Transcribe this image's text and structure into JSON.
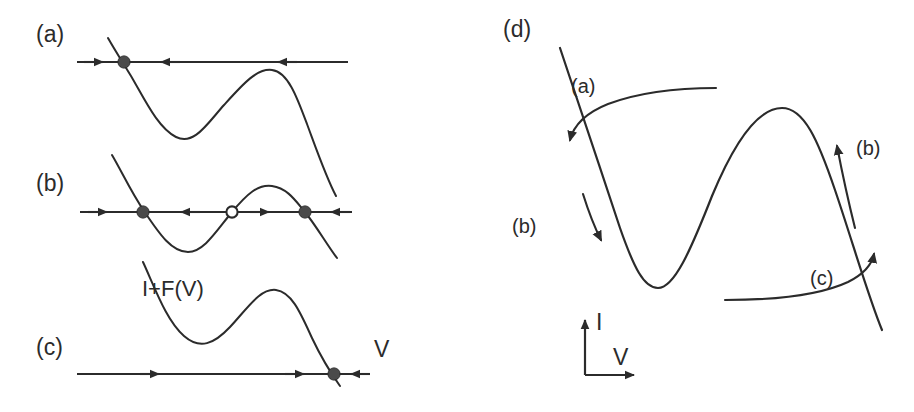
{
  "figure": {
    "width": 914,
    "height": 412,
    "background_color": "#ffffff",
    "ink_color": "#2b2b2b"
  },
  "panels": [
    {
      "id": "a",
      "label": "(a)",
      "description": "Phase line with one stable fixed point on the left branch; flow arrows point right then left toward it.",
      "fixed_points": [
        {
          "type": "filled",
          "role": "stable",
          "x": 124,
          "y": 62
        }
      ],
      "flow_arrows": [
        {
          "direction": "right",
          "x": 95,
          "y": 62
        },
        {
          "direction": "left",
          "x": 168,
          "y": 62
        },
        {
          "direction": "left",
          "x": 284,
          "y": 62
        }
      ]
    },
    {
      "id": "b",
      "label": "(b)",
      "description": "Phase line with three fixed points: stable, unstable (open), stable; bistable regime.",
      "fixed_points": [
        {
          "type": "filled",
          "role": "stable",
          "x": 143,
          "y": 212
        },
        {
          "type": "open",
          "role": "unstable",
          "x": 232,
          "y": 212
        },
        {
          "type": "filled",
          "role": "stable",
          "x": 305,
          "y": 212
        }
      ],
      "flow_arrows": [
        {
          "direction": "right",
          "x": 110,
          "y": 212
        },
        {
          "direction": "left",
          "x": 188,
          "y": 212
        },
        {
          "direction": "right",
          "x": 268,
          "y": 212
        },
        {
          "direction": "left",
          "x": 338,
          "y": 212
        }
      ]
    },
    {
      "id": "c",
      "label": "(c)",
      "description": "Phase line with one stable fixed point on the right branch; flow arrows point right toward it and left from beyond it.",
      "fixed_points": [
        {
          "type": "filled",
          "role": "stable",
          "x": 334,
          "y": 374
        }
      ],
      "flow_arrows": [
        {
          "direction": "right",
          "x": 158,
          "y": 374
        },
        {
          "direction": "right",
          "x": 303,
          "y": 374
        },
        {
          "direction": "left",
          "x": 357,
          "y": 374
        }
      ]
    },
    {
      "id": "d",
      "label": "(d)",
      "description": "N-shaped I+F(V) nullcline with hysteresis-loop flow directions labelled (a), (b), (b) and (c).",
      "flow_labels": [
        {
          "text": "(a)",
          "x": 571,
          "y": 78,
          "meaning": "upper branch trajectory moving left and down"
        },
        {
          "text": "(b)",
          "x": 516,
          "y": 218,
          "meaning": "left descending branch moving down"
        },
        {
          "text": "(b)",
          "x": 855,
          "y": 140,
          "meaning": "right ascending branch moving up"
        },
        {
          "text": "(c)",
          "x": 812,
          "y": 270,
          "meaning": "lower branch trajectory moving right and up"
        }
      ],
      "axes": {
        "current_label": "I",
        "voltage_label": "V",
        "origin": {
          "x": 585,
          "y": 375
        }
      }
    }
  ],
  "annotations": {
    "curve_label": "I+F(V)",
    "curve_label_position": {
      "x": 142,
      "y": 282
    },
    "v_axis_label": "V",
    "v_axis_label_position": {
      "x": 374,
      "y": 340
    }
  },
  "icons": {
    "arrow_right": "arrow-right-icon",
    "arrow_left": "arrow-left-icon",
    "arrow_up": "arrow-up-icon",
    "arrow_down": "arrow-down-icon",
    "stable-point": "filled-circle-icon",
    "unstable-point": "open-circle-icon"
  }
}
